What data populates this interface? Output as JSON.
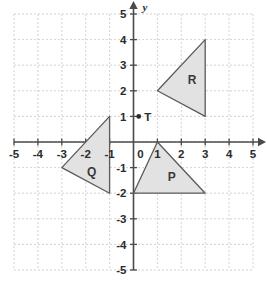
{
  "chart_data": {
    "type": "scatter",
    "title": "",
    "xlabel": "x",
    "ylabel": "y",
    "xlim": [
      -5,
      5
    ],
    "ylim": [
      -5,
      5
    ],
    "grid": true,
    "legend_position": "none",
    "x_ticks": [
      "-5",
      "-4",
      "-3",
      "-2",
      "-1",
      "0",
      "1",
      "2",
      "3",
      "4",
      "5"
    ],
    "x_tick_values": [
      -5,
      -4,
      -3,
      -2,
      -1,
      0,
      1,
      2,
      3,
      4,
      5
    ],
    "y_ticks": [
      "5",
      "4",
      "3",
      "2",
      "1",
      "0",
      "-1",
      "-2",
      "-3",
      "-4",
      "-5"
    ],
    "y_tick_values": [
      5,
      4,
      3,
      2,
      1,
      0,
      -1,
      -2,
      -3,
      -4,
      -5
    ],
    "axis_arrows": [
      "x-positive",
      "y-positive"
    ],
    "shapes": [
      {
        "name": "P",
        "label": "P",
        "kind": "triangle",
        "vertices": [
          [
            1,
            0
          ],
          [
            0,
            -2
          ],
          [
            3,
            -2
          ]
        ],
        "label_position": [
          1.6,
          -1.35
        ],
        "fill": "#e2e2e2",
        "stroke": "#5a5a5a"
      },
      {
        "name": "Q",
        "label": "Q",
        "kind": "triangle",
        "vertices": [
          [
            -1,
            1
          ],
          [
            -3,
            -1
          ],
          [
            -1,
            -2
          ]
        ],
        "label_position": [
          -1.75,
          -1.15
        ],
        "fill": "#e2e2e2",
        "stroke": "#5a5a5a"
      },
      {
        "name": "R",
        "label": "R",
        "kind": "triangle",
        "vertices": [
          [
            1,
            2
          ],
          [
            3,
            4
          ],
          [
            3,
            1
          ]
        ],
        "label_position": [
          2.45,
          2.45
        ],
        "fill": "#e2e2e2",
        "stroke": "#5a5a5a"
      }
    ],
    "points": [
      {
        "name": "T",
        "label": "T",
        "coordinates": [
          0.22,
          1
        ],
        "label_position": [
          0.45,
          1
        ],
        "color": "#2b2b2b"
      }
    ],
    "colors": {
      "grid": "#d2d2d8",
      "axis": "#4a4a4a",
      "shape_fill": "#e2e2e2",
      "shape_stroke": "#5a5a5a",
      "text": "#2b2b2b"
    }
  }
}
